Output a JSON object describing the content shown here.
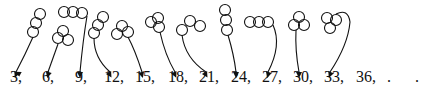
{
  "diagram": {
    "stroke_color": "#111111",
    "sequence": [
      {
        "label": "3,",
        "x": 10
      },
      {
        "label": "6,",
        "x": 42
      },
      {
        "label": "9,",
        "x": 75
      },
      {
        "label": "12,",
        "x": 104
      },
      {
        "label": "15,",
        "x": 135
      },
      {
        "label": "18,",
        "x": 168
      },
      {
        "label": "21,",
        "x": 199
      },
      {
        "label": "24,",
        "x": 231
      },
      {
        "label": "27,",
        "x": 262
      },
      {
        "label": "30,",
        "x": 293
      },
      {
        "label": "33,",
        "x": 324
      },
      {
        "label": "36,",
        "x": 356
      }
    ],
    "ellipsis": ". . ."
  }
}
